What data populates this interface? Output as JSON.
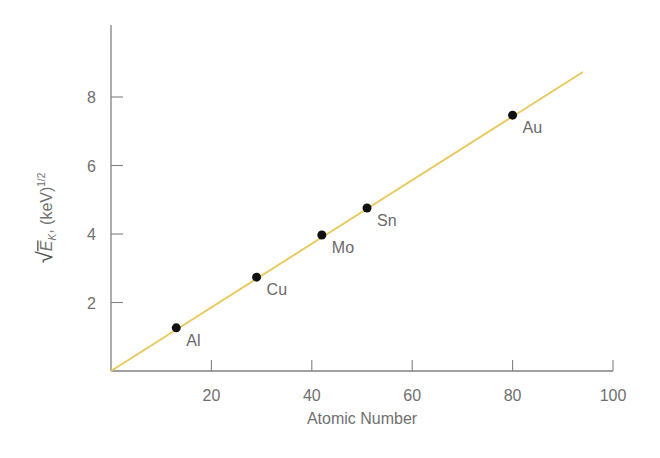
{
  "chart_data": {
    "type": "scatter",
    "title": "",
    "xlabel": "Atomic Number",
    "ylabel": "√E_K, (keV)^1/2",
    "ylabel_parts": {
      "radicand": "E",
      "subscript": "K",
      "unit": ", (keV)",
      "exponent": "1/2"
    },
    "xlim": [
      0,
      100
    ],
    "ylim": [
      0,
      10
    ],
    "x_ticks": [
      20,
      40,
      60,
      80,
      100
    ],
    "y_ticks": [
      2,
      4,
      6,
      8
    ],
    "grid": false,
    "legend": null,
    "points": [
      {
        "label": "Al",
        "x": 13,
        "y": 1.26
      },
      {
        "label": "Cu",
        "x": 29,
        "y": 2.74
      },
      {
        "label": "Mo",
        "x": 42,
        "y": 3.97
      },
      {
        "label": "Sn",
        "x": 51,
        "y": 4.76
      },
      {
        "label": "Au",
        "x": 80,
        "y": 7.47
      }
    ],
    "fit_line": {
      "x0": 0,
      "y0": 0,
      "x1": 94,
      "y1": 8.73,
      "color": "#e8c85a"
    },
    "colors": {
      "axis": "#808080",
      "point": "#111111",
      "line": "#e8c85a"
    }
  }
}
